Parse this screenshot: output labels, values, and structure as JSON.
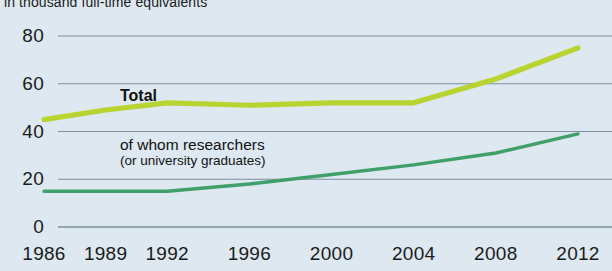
{
  "subtitle": "in thousand full-time equivalents",
  "colors": {
    "background": "#dde8f0",
    "total_line": "#b9d331",
    "researchers_line": "#3fa06a",
    "gridline": "#5c7384",
    "text": "#1b1b1b"
  },
  "labels": {
    "total": "Total",
    "researchers": "of whom researchers",
    "researchers_sub": "(or university graduates)"
  },
  "chart_data": {
    "type": "line",
    "title": "",
    "subtitle": "in thousand full-time equivalents",
    "xlabel": "",
    "ylabel": "",
    "ylim": [
      0,
      85
    ],
    "yticks": [
      0,
      20,
      40,
      60,
      80
    ],
    "xticks": [
      "1986",
      "1989",
      "1992",
      "1996",
      "2000",
      "2004",
      "2008",
      "2012"
    ],
    "x": [
      1986,
      1989,
      1992,
      1996,
      2000,
      2004,
      2008,
      2012
    ],
    "grid": true,
    "legend": "annotations-inline",
    "series": [
      {
        "name": "Total",
        "color": "#b9d331",
        "values": [
          45,
          49,
          52,
          51,
          52,
          52,
          62,
          75
        ]
      },
      {
        "name": "of whom researchers (or university graduates)",
        "color": "#3fa06a",
        "values": [
          15,
          15,
          15,
          18,
          22,
          26,
          31,
          39
        ]
      }
    ]
  }
}
